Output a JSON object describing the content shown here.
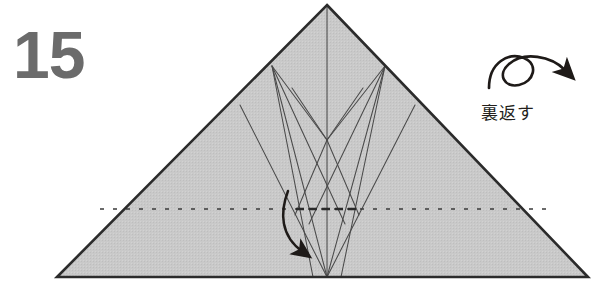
{
  "page": {
    "width": 598,
    "height": 287,
    "background_color": "#ffffff",
    "kind": "origami-instruction-step"
  },
  "step": {
    "number": "15",
    "number_color": "#6b6b6b"
  },
  "instruction": {
    "caption": "裏返す",
    "caption_romaji_meaning": "turn over",
    "caption_color": "#231f1c",
    "flip_symbol": "turn-over-loop-arrow"
  },
  "figure": {
    "name": "folded-paper-triangle",
    "paper_fill": "#c8c8c8",
    "outline_color": "#2b2b2b",
    "crease_color": "#4a4a4a",
    "dotted_line_color": "#3a3a3a",
    "arrow_color": "#1e1a18",
    "outline": {
      "apex": [
        327,
        5
      ],
      "bottom_left": [
        57,
        277
      ],
      "bottom_right": [
        588,
        277
      ]
    },
    "key_points": {
      "center_bottom": [
        327,
        277
      ],
      "left_fan_vertex": [
        272,
        66
      ],
      "right_fan_vertex": [
        385,
        66
      ],
      "left_diagonal_start": [
        240,
        105
      ],
      "right_diagonal_start": [
        415,
        105
      ],
      "v_crease_vertex": [
        327,
        140
      ],
      "dotted_line_y": 209
    }
  },
  "icons": {
    "loop_arrow": "turn-over-arrow",
    "fold_arrow": "valley-fold-curved-arrow"
  }
}
